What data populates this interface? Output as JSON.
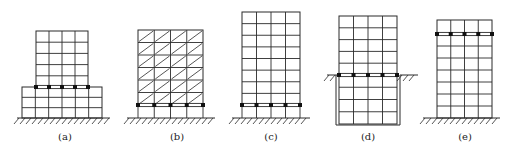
{
  "figure": {
    "line_color": "#2a2a2a",
    "bearing_color": "#111111",
    "panels": [
      {
        "id": "a",
        "label": "(a)",
        "type": "podium-isolation",
        "tower": {
          "x": 36,
          "y": 31,
          "w": 52,
          "h": 56,
          "cols": 4,
          "rows": 5
        },
        "podium": {
          "x": 22,
          "y": 87,
          "w": 80,
          "h": 31,
          "cols": 6,
          "rows": 3
        },
        "bearing_level_y": 87,
        "bearing_span": [
          36,
          88
        ],
        "ground": {
          "y": 118,
          "x1": 17,
          "x2": 110
        },
        "label_pos": [
          65,
          140
        ]
      },
      {
        "id": "b",
        "label": "(b)",
        "type": "base-isolation-hatched",
        "frame": {
          "x": 138,
          "y": 30,
          "w": 65,
          "h": 75,
          "cols": 4,
          "rows": 6,
          "hatched": true
        },
        "bearing_level_y": 105,
        "ground": {
          "y": 118,
          "x1": 127,
          "x2": 215
        },
        "label_pos": [
          177,
          140
        ]
      },
      {
        "id": "c",
        "label": "(c)",
        "type": "base-isolation",
        "frame": {
          "x": 242,
          "y": 12,
          "w": 58,
          "h": 93,
          "cols": 4,
          "rows": 8
        },
        "bearing_level_y": 105,
        "ground": {
          "y": 118,
          "x1": 232,
          "x2": 310
        },
        "label_pos": [
          271,
          140
        ]
      },
      {
        "id": "d",
        "label": "(d)",
        "type": "basement-isolation",
        "frame": {
          "x": 339,
          "y": 16,
          "w": 58,
          "h": 108,
          "cols": 4,
          "rows_above": 5,
          "rows_below": 4
        },
        "bearing_level_y": 75,
        "ground": {
          "y": 75,
          "left": [
            327,
            337
          ],
          "right": [
            400,
            418
          ]
        },
        "label_pos": [
          368,
          140
        ]
      },
      {
        "id": "e",
        "label": "(e)",
        "type": "upper-story-isolation",
        "frame": {
          "x": 437,
          "y": 20,
          "w": 55,
          "h": 98,
          "cols": 4,
          "rows_above": 1,
          "rows_below": 7
        },
        "bearing_level_y": 34,
        "ground": {
          "y": 118,
          "x1": 423,
          "x2": 500
        },
        "label_pos": [
          465,
          140
        ]
      }
    ]
  }
}
